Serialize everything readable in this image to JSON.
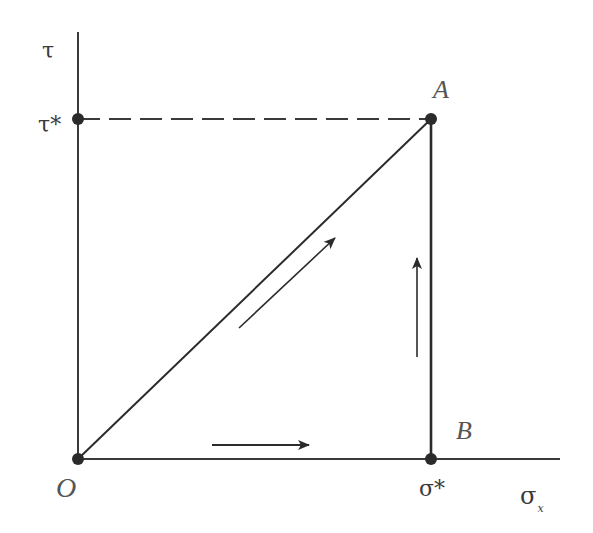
{
  "diagram": {
    "type": "stress-path",
    "colors": {
      "line": "#2b2b2b",
      "label": "#3a3a3a",
      "background": "#ffffff"
    },
    "axes": {
      "vertical": {
        "label": "τ"
      },
      "horizontal": {
        "label": "σ",
        "subscript": "x"
      }
    },
    "ticks": {
      "tau_star": "τ*",
      "sigma_star": "σ*"
    },
    "points": {
      "origin": "O",
      "A": "A",
      "B": "B"
    },
    "paths": [
      {
        "from": "O",
        "to": "A",
        "style": "solid",
        "arrow": "diagonal-up-right"
      },
      {
        "from": "O",
        "to": "B",
        "style": "solid",
        "arrow": "right"
      },
      {
        "from": "B",
        "to": "A",
        "style": "solid",
        "arrow": "up"
      },
      {
        "from": "τ*",
        "to": "A",
        "style": "dashed",
        "arrow": "none"
      }
    ]
  }
}
